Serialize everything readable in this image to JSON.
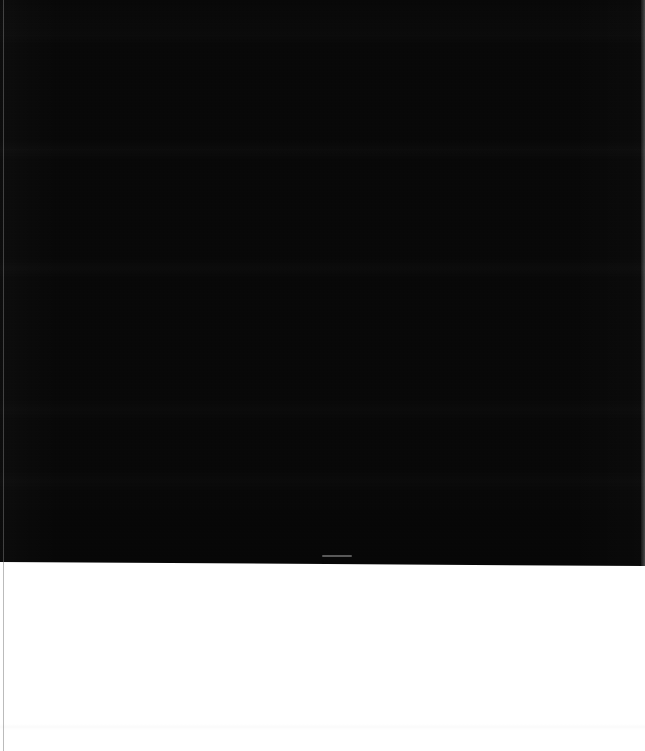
{
  "capture": {
    "width": 645,
    "height": 751,
    "state": "blank",
    "description": "Screen capture containing no rendered interface content: a near-black upper area over an empty white lower area."
  },
  "regions": {
    "dark": {
      "name": "blank-dark-area",
      "color": "#070707",
      "top": 0,
      "height_left": 562,
      "height_right": 566,
      "content": ""
    },
    "white": {
      "name": "blank-white-area",
      "color": "#ffffff",
      "top": 562,
      "height": 189,
      "content": ""
    }
  },
  "artifacts": {
    "left_edge_line": {
      "name": "left-edge-line",
      "color": "#787878",
      "x": 3,
      "width": 1
    },
    "right_edge_strip": {
      "name": "right-edge-strip",
      "color": "#ffffff",
      "width": 4
    },
    "streak": {
      "name": "gray-streak-artifact",
      "color": "#bebebe",
      "x": 322,
      "y": 555,
      "width": 30,
      "height": 2
    }
  },
  "text": {
    "visible_text": [],
    "note": ""
  }
}
